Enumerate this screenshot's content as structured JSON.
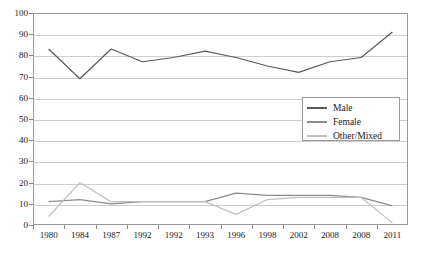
{
  "chart_data": {
    "type": "line",
    "title": "",
    "xlabel": "",
    "ylabel": "",
    "ylim": [
      0,
      100
    ],
    "ytick_step": 10,
    "yticks": [
      0,
      10,
      20,
      30,
      40,
      50,
      60,
      70,
      80,
      90,
      100
    ],
    "grid": true,
    "legend_position": "center-right",
    "categories": [
      "1980",
      "1984",
      "1987",
      "1992",
      "1992",
      "1993",
      "1996",
      "1998",
      "2002",
      "2008",
      "2008",
      "2011"
    ],
    "series": [
      {
        "name": "Male",
        "color": "#595959",
        "values": [
          83,
          69,
          83,
          77,
          79,
          82,
          79,
          75,
          72,
          77,
          79,
          91
        ]
      },
      {
        "name": "Female",
        "color": "#8c8c8c",
        "values": [
          11,
          12,
          10,
          11,
          11,
          11,
          15,
          14,
          14,
          14,
          13,
          9
        ]
      },
      {
        "name": "Other/Mixed",
        "color": "#bfbfbf",
        "values": [
          4,
          20,
          11,
          11,
          11,
          11,
          5,
          12,
          13,
          13,
          13,
          1
        ]
      }
    ]
  },
  "legend": {
    "entries": [
      {
        "label": "Male"
      },
      {
        "label": "Female"
      },
      {
        "label": "Other/Mixed"
      }
    ]
  }
}
